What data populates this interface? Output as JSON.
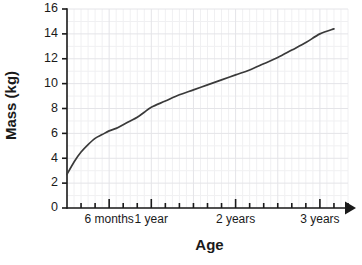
{
  "chart_data": {
    "type": "line",
    "title": "",
    "xlabel": "Age",
    "ylabel": "Mass (kg)",
    "ylim": [
      0,
      16
    ],
    "xlim": [
      0,
      40
    ],
    "grid": true,
    "legend": "none",
    "y_ticks": [
      0,
      2,
      4,
      6,
      8,
      10,
      12,
      14,
      16
    ],
    "y_tick_labels": [
      "0",
      "2",
      "4",
      "6",
      "8",
      "10",
      "12",
      "14",
      "16"
    ],
    "x_major_ticks_months": [
      6,
      12,
      24,
      36
    ],
    "x_tick_labels": [
      "6 months",
      "1 year",
      "2 years",
      "3 years"
    ],
    "x_minor_tick_interval_months": 2,
    "series": [
      {
        "name": "Mass",
        "x_units": "months",
        "x": [
          0,
          1,
          2,
          3,
          4,
          5,
          6,
          7,
          8,
          9,
          10,
          11,
          12,
          14,
          16,
          18,
          20,
          22,
          24,
          26,
          28,
          30,
          32,
          34,
          36,
          38
        ],
        "values": [
          2.7,
          3.7,
          4.5,
          5.1,
          5.6,
          5.9,
          6.2,
          6.4,
          6.7,
          7.0,
          7.3,
          7.7,
          8.1,
          8.6,
          9.1,
          9.5,
          9.9,
          10.3,
          10.7,
          11.1,
          11.6,
          12.1,
          12.7,
          13.3,
          14.0,
          14.4
        ]
      }
    ]
  },
  "axes": {
    "y_title": "Mass (kg)",
    "x_title": "Age"
  },
  "colors": {
    "curve": "#3a3a3a",
    "axis": "#1a1a1a",
    "grid_minor": "#f0f0f2",
    "grid_major": "#e4e4e8",
    "text": "#1a1a1a",
    "background": "#ffffff"
  }
}
